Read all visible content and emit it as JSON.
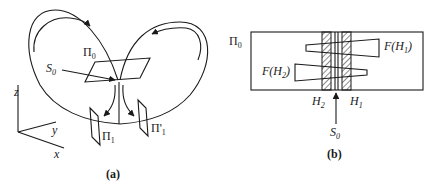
{
  "panel_a": {
    "caption": "(a)",
    "labels": {
      "pi0": "Π",
      "pi0_sub": "0",
      "s0": "S",
      "s0_sub": "0",
      "pi1": "Π",
      "pi1_sub": "1",
      "pi1p": "Π'",
      "pi1p_sub": "1",
      "axis_z": "z",
      "axis_y": "y",
      "axis_x": "x"
    }
  },
  "panel_b": {
    "caption": "(b)",
    "labels": {
      "pi0": "Π",
      "pi0_sub": "0",
      "fh1": "F(H",
      "fh1_sub": "1",
      "fh1_close": ")",
      "fh2": "F(H",
      "fh2_sub": "2",
      "fh2_close": ")",
      "h2": "H",
      "h2_sub": "2",
      "h1": "H",
      "h1_sub": "1",
      "s0": "S",
      "s0_sub": "0"
    }
  },
  "colors": {
    "ink": "#1a1a1a",
    "background": "#ffffff"
  }
}
